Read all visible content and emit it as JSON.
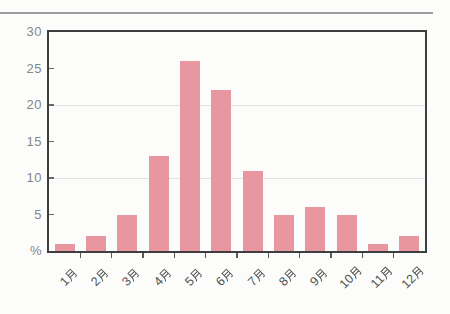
{
  "page": {
    "background": "#fcfcfb"
  },
  "top_rule": {
    "color": "#9d9d9d"
  },
  "chart_data": {
    "type": "bar",
    "title": "",
    "xlabel": "",
    "ylabel": "%",
    "categories": [
      "1月",
      "2月",
      "3月",
      "4月",
      "5月",
      "6月",
      "7月",
      "8月",
      "9月",
      "10月",
      "11月",
      "12月"
    ],
    "values": [
      1,
      2,
      5,
      13,
      26,
      22,
      11,
      5,
      6,
      5,
      1,
      2
    ],
    "ylim": [
      0,
      30
    ],
    "ytick_values": [
      30,
      25,
      20,
      15,
      10,
      5,
      0
    ],
    "ytick_labels": [
      "30",
      "25",
      "20",
      "15",
      "10",
      "5",
      "%"
    ],
    "gridlines_at": [
      20,
      10
    ],
    "grid_on": true,
    "legend": null,
    "bar_color": "#e896a0",
    "frame_color": "#3e3e3e",
    "grid_color": "#e2e2e2",
    "ytick_label_color": "#868686",
    "xtick_label_color": "#525252"
  }
}
